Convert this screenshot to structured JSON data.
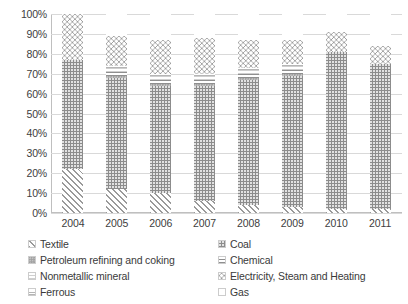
{
  "chart_data": {
    "type": "bar",
    "subtype": "100% stacked column",
    "title": "",
    "xlabel": "",
    "ylabel": "",
    "ylim": [
      0,
      100
    ],
    "y_tick_labels": [
      "0%",
      "10%",
      "20%",
      "30%",
      "40%",
      "50%",
      "60%",
      "70%",
      "80%",
      "90%",
      "100%"
    ],
    "y_ticks": [
      0,
      10,
      20,
      30,
      40,
      50,
      60,
      70,
      80,
      90,
      100
    ],
    "grid": true,
    "legend_position": "bottom",
    "categories": [
      "2004",
      "2005",
      "2006",
      "2007",
      "2008",
      "2009",
      "2010",
      "2011"
    ],
    "series": [
      {
        "name": "Textile",
        "pattern": "diagonal-hatch",
        "values": [
          22,
          12,
          10,
          6,
          4,
          3,
          2,
          2
        ]
      },
      {
        "name": "Coal",
        "pattern": "dotted-dark-gray",
        "values": [
          55,
          56,
          54,
          58,
          63,
          66,
          79,
          73
        ]
      },
      {
        "name": "Petroleum refining and coking",
        "pattern": "fine-dot-gray",
        "values": [
          0,
          1,
          1,
          1,
          1,
          1,
          0,
          0
        ]
      },
      {
        "name": "Chemical",
        "pattern": "horizontal-lines",
        "values": [
          0,
          2,
          2,
          2,
          2,
          2,
          0,
          0
        ]
      },
      {
        "name": "Nonmetallic mineral",
        "pattern": "light-fill",
        "values": [
          0,
          2,
          2,
          2,
          2,
          2,
          0,
          0
        ]
      },
      {
        "name": "Ferrous",
        "pattern": "thin-lines",
        "values": [
          0,
          1,
          1,
          1,
          1,
          1,
          0,
          0
        ]
      },
      {
        "name": "Electricity, Steam and Heating",
        "pattern": "circles",
        "values": [
          23,
          15,
          17,
          18,
          14,
          12,
          10,
          9
        ]
      },
      {
        "name": "Gas",
        "pattern": "sparse-crosses",
        "values": [
          0,
          11,
          13,
          12,
          13,
          13,
          9,
          16
        ]
      }
    ],
    "stack_order_bottom_to_top": [
      "Textile",
      "Coal",
      "Petroleum refining and coking",
      "Chemical",
      "Nonmetallic mineral",
      "Ferrous",
      "Electricity, Steam and Heating",
      "Gas"
    ]
  },
  "legend": {
    "left_column": [
      {
        "label": "Textile",
        "swatch": "diagonal-hatch"
      },
      {
        "label": "Petroleum refining and coking",
        "swatch": "fine-dot-gray"
      },
      {
        "label": "Nonmetallic mineral",
        "swatch": "light-fill"
      },
      {
        "label": "Ferrous",
        "swatch": "thin-lines"
      }
    ],
    "right_column": [
      {
        "label": "Coal",
        "swatch": "dotted-dark-gray"
      },
      {
        "label": "Chemical",
        "swatch": "horizontal-lines"
      },
      {
        "label": "Electricity, Steam and Heating",
        "swatch": "circles"
      },
      {
        "label": "Gas",
        "swatch": "sparse-crosses"
      }
    ]
  },
  "colors": {
    "grid": "#d9d9d9",
    "axis": "#bfbfbf",
    "text": "#3a3a3a",
    "coal_fill": "#8c8c8c",
    "background": "#ffffff"
  }
}
